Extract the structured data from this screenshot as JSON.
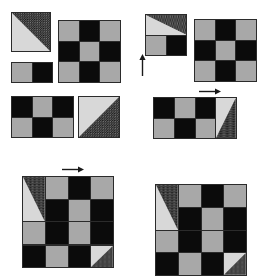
{
  "canvas": {
    "width": 266,
    "height": 258,
    "background": "#ffffff"
  },
  "palette": {
    "black": "#0b0b0b",
    "gray": "#a8a8a8",
    "light": "#d8d8d8",
    "speckle_dark": "#111111",
    "speckle_dot": "#e8e8e8",
    "border": "#2b2b2b",
    "arrow": "#1a1a1a"
  },
  "legend": {
    "B": "black-square",
    "G": "gray-square",
    "T": "triangle-speckled-upper-right",
    "M": "triangle-speckled-lower-right"
  },
  "panels": [
    {
      "name": "panel-top-left",
      "pieces": [
        {
          "name": "tile-triangle-single",
          "x": 11,
          "y": 12,
          "cols": 1,
          "rows": 1,
          "cell": 40,
          "grid": [
            [
              "T"
            ]
          ]
        },
        {
          "name": "tile-domino-2x1",
          "x": 11,
          "y": 62,
          "cols": 2,
          "rows": 1,
          "cell": 21,
          "grid": [
            [
              "G",
              "B"
            ]
          ]
        },
        {
          "name": "tile-checker-3x3",
          "x": 58,
          "y": 20,
          "cols": 3,
          "rows": 3,
          "cell": 21,
          "grid": [
            [
              "G",
              "B",
              "G"
            ],
            [
              "B",
              "G",
              "B"
            ],
            [
              "G",
              "B",
              "G"
            ]
          ]
        },
        {
          "name": "tile-checker-3x2",
          "x": 11,
          "y": 96,
          "cols": 3,
          "rows": 2,
          "cell": 21,
          "grid": [
            [
              "B",
              "G",
              "B"
            ],
            [
              "G",
              "B",
              "G"
            ]
          ]
        },
        {
          "name": "tile-triangle-right",
          "x": 78,
          "y": 96,
          "cols": 1,
          "rows": 1,
          "cell": 42,
          "grid": [
            [
              "M"
            ]
          ]
        }
      ],
      "arrows": []
    },
    {
      "name": "panel-top-right",
      "pieces": [
        {
          "name": "tile-combined-triangle-domino",
          "x": 145,
          "y": 14,
          "cols": 2,
          "rows": 2,
          "cell": 21,
          "grid": [
            [
              "T",
              "T"
            ],
            [
              "G",
              "B"
            ]
          ],
          "merge_top_triangle": true
        },
        {
          "name": "tile-checker-3x3",
          "x": 194,
          "y": 19,
          "cols": 3,
          "rows": 3,
          "cell": 21,
          "grid": [
            [
              "G",
              "B",
              "G"
            ],
            [
              "B",
              "G",
              "B"
            ],
            [
              "G",
              "B",
              "G"
            ]
          ]
        },
        {
          "name": "tile-combined-4x2",
          "x": 153,
          "y": 97,
          "cols": 4,
          "rows": 2,
          "cell": 21,
          "grid": [
            [
              "B",
              "G",
              "B",
              "M"
            ],
            [
              "G",
              "B",
              "G",
              "M"
            ]
          ],
          "merge_right_triangle": true
        }
      ],
      "arrows": [
        {
          "name": "arrow-up",
          "x": 139,
          "y": 54,
          "length": 22,
          "direction": "up"
        },
        {
          "name": "arrow-right",
          "x": 199,
          "y": 88,
          "length": 22,
          "direction": "right"
        }
      ]
    },
    {
      "name": "panel-bottom-left",
      "pieces": [
        {
          "name": "tile-assembled-4x3",
          "x": 22,
          "y": 176,
          "cols": 4,
          "rows": 3,
          "cell": 23,
          "grid": [
            [
              "T",
              "G",
              "B",
              "G"
            ],
            [
              "T",
              "B",
              "G",
              "B"
            ],
            [
              "G",
              "B",
              "G",
              "B"
            ]
          ],
          "merge_left_triangle": true
        },
        {
          "name": "tile-strip-4x1",
          "x": 22,
          "y": 245,
          "cols": 4,
          "rows": 1,
          "cell": 23,
          "grid": [
            [
              "B",
              "G",
              "B",
              "M"
            ]
          ]
        }
      ],
      "arrows": [
        {
          "name": "arrow-right",
          "x": 62,
          "y": 166,
          "length": 22,
          "direction": "right"
        }
      ]
    },
    {
      "name": "panel-bottom-right",
      "pieces": [
        {
          "name": "tile-assembled-4x4",
          "x": 155,
          "y": 184,
          "cols": 4,
          "rows": 4,
          "cell": 23,
          "grid": [
            [
              "T",
              "G",
              "B",
              "G"
            ],
            [
              "T",
              "B",
              "G",
              "B"
            ],
            [
              "G",
              "B",
              "G",
              "B"
            ],
            [
              "B",
              "G",
              "B",
              "M"
            ]
          ],
          "merge_left_triangle": true
        }
      ],
      "arrows": []
    }
  ]
}
